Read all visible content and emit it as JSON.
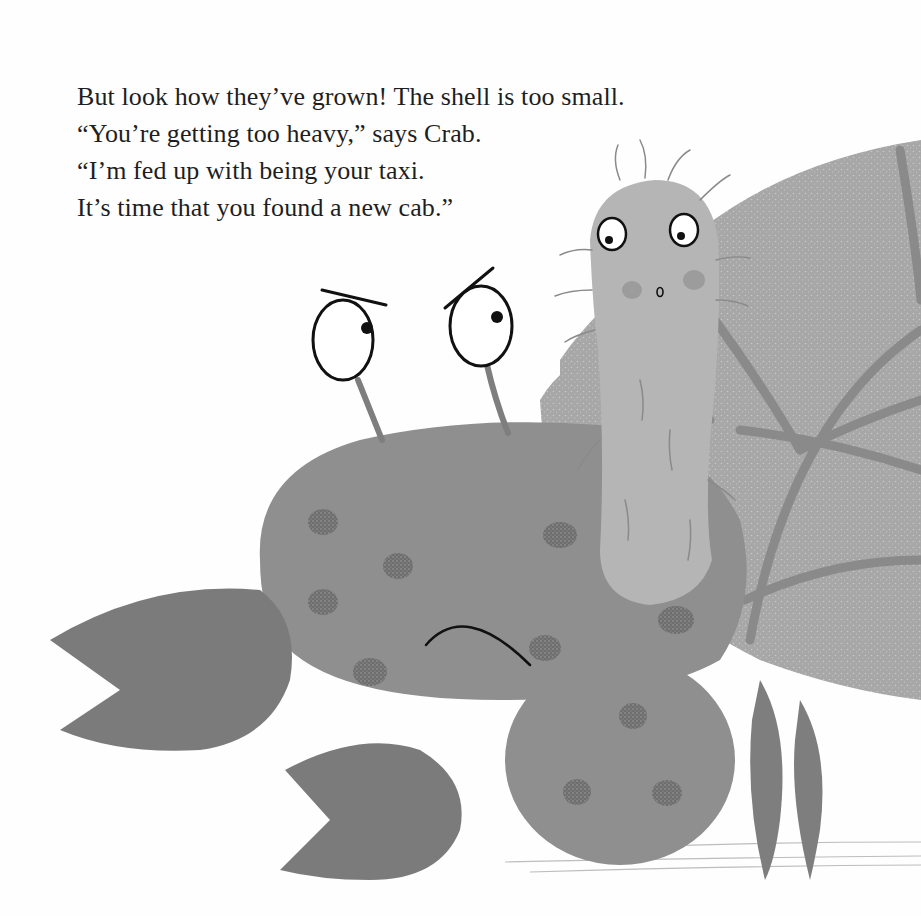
{
  "page": {
    "type": "picture-book-page",
    "palette": {
      "background": "#fefefe",
      "crab_body": "#8f8f8f",
      "crab_claw": "#7b7b7b",
      "crab_spots": "#777777",
      "shell_fill": "#a9a9a9",
      "shell_stripes": "#8a8a8a",
      "creature_body": "#b5b5b5",
      "ink": "#111111"
    }
  },
  "story": {
    "lines": [
      "But look how they’ve grown! The shell is too small.",
      "“You’re getting too heavy,” says Crab.",
      "“I’m fed up with being your taxi.",
      "It’s time that you found a new cab.”"
    ]
  },
  "illustration": {
    "characters": [
      {
        "name": "crab",
        "expression": "angry frown"
      },
      {
        "name": "hermit-creature",
        "expression": "surprised"
      }
    ],
    "objects": [
      "spiral-shell",
      "seabed-line"
    ]
  }
}
